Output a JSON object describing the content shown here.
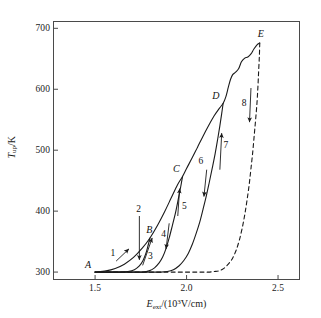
{
  "chart_data": {
    "type": "line",
    "title": "",
    "xlabel": "E_ext/(10^3 V/cm)",
    "ylabel": "T_up/K",
    "xlim": [
      1.27,
      2.62
    ],
    "ylim": [
      287,
      712
    ],
    "xticks": [
      "1.5",
      "2.0",
      "2.5"
    ],
    "xtick_values": [
      1.5,
      2.0,
      2.5
    ],
    "yticks": [
      "300",
      "400",
      "500",
      "600",
      "700"
    ],
    "ytick_values": [
      300,
      400,
      500,
      600,
      700
    ],
    "grid": false,
    "legend": null,
    "axis_title_x_parts": {
      "symbol": "E",
      "subscript": "ext",
      "rest_open": "/(10",
      "exponent": "3",
      "rest_close": "V/cm)"
    },
    "axis_title_y_parts": {
      "symbol": "T",
      "subscript": "up",
      "rest": "/K"
    },
    "annotations": {
      "points": [
        {
          "label": "A",
          "x": 1.5,
          "y": 300,
          "label_dx": -10,
          "label_dy": -12
        },
        {
          "label": "B",
          "x": 1.79,
          "y": 356,
          "label_dx": -2,
          "label_dy": -13
        },
        {
          "label": "C",
          "x": 1.98,
          "y": 457,
          "label_dx": -10,
          "label_dy": -12
        },
        {
          "label": "D",
          "x": 2.2,
          "y": 577,
          "label_dx": -11,
          "label_dy": -12
        },
        {
          "label": "E",
          "x": 2.4,
          "y": 676,
          "label_dx": -2,
          "label_dy": -14
        }
      ],
      "arrows": [
        {
          "label": "1",
          "x1": 1.615,
          "y1": 318,
          "x2": 1.685,
          "y2": 338,
          "lx": 1.6,
          "ly": 332,
          "dir": "up-right"
        },
        {
          "label": "2",
          "x1": 1.742,
          "y1": 392,
          "x2": 1.742,
          "y2": 320,
          "lx": 1.742,
          "ly": 404,
          "dir": "down"
        },
        {
          "label": "3",
          "x1": 1.76,
          "y1": 311,
          "x2": 1.812,
          "y2": 356,
          "lx": 1.805,
          "ly": 327,
          "dir": "up-right"
        },
        {
          "label": "4",
          "x1": 1.905,
          "y1": 380,
          "x2": 1.888,
          "y2": 338,
          "lx": 1.878,
          "ly": 362,
          "dir": "down"
        },
        {
          "label": "5",
          "x1": 1.952,
          "y1": 392,
          "x2": 1.962,
          "y2": 437,
          "lx": 1.992,
          "ly": 408,
          "dir": "up"
        },
        {
          "label": "6",
          "x1": 2.11,
          "y1": 468,
          "x2": 2.095,
          "y2": 424,
          "lx": 2.082,
          "ly": 482,
          "dir": "down"
        },
        {
          "label": "7",
          "x1": 2.182,
          "y1": 468,
          "x2": 2.192,
          "y2": 528,
          "lx": 2.218,
          "ly": 508,
          "dir": "up"
        },
        {
          "label": "8",
          "x1": 2.352,
          "y1": 602,
          "x2": 2.344,
          "y2": 546,
          "lx": 2.318,
          "ly": 578,
          "dir": "down"
        }
      ]
    },
    "series": [
      {
        "name": "loop-1-outer-up (A to B to C to D to E, main envelope)",
        "style": "solid",
        "points": [
          [
            1.5,
            300
          ],
          [
            1.56,
            302
          ],
          [
            1.61,
            306
          ],
          [
            1.66,
            313
          ],
          [
            1.71,
            324
          ],
          [
            1.76,
            340
          ],
          [
            1.8,
            356
          ],
          [
            1.84,
            376
          ],
          [
            1.88,
            399
          ],
          [
            1.915,
            421
          ],
          [
            1.95,
            443
          ],
          [
            1.978,
            457
          ],
          [
            2.0,
            470
          ],
          [
            2.03,
            487
          ],
          [
            2.06,
            505
          ],
          [
            2.09,
            523
          ],
          [
            2.12,
            540
          ],
          [
            2.15,
            556
          ],
          [
            2.18,
            569
          ],
          [
            2.2,
            577
          ],
          [
            2.215,
            588
          ],
          [
            2.228,
            603
          ],
          [
            2.24,
            616
          ],
          [
            2.252,
            624
          ],
          [
            2.268,
            628
          ],
          [
            2.285,
            634
          ],
          [
            2.3,
            645
          ],
          [
            2.318,
            651
          ],
          [
            2.335,
            653
          ],
          [
            2.352,
            658
          ],
          [
            2.368,
            666
          ],
          [
            2.385,
            673
          ],
          [
            2.4,
            676
          ]
        ]
      },
      {
        "name": "branch-B-return (loop 1: down from B back to baseline)",
        "style": "solid",
        "points": [
          [
            1.8,
            356
          ],
          [
            1.79,
            344
          ],
          [
            1.778,
            331
          ],
          [
            1.762,
            319
          ],
          [
            1.742,
            310
          ],
          [
            1.715,
            304
          ],
          [
            1.68,
            301
          ],
          [
            1.64,
            300
          ],
          [
            1.6,
            300
          ],
          [
            1.56,
            300
          ],
          [
            1.52,
            300
          ],
          [
            1.5,
            300
          ]
        ]
      },
      {
        "name": "branch-C-return (loop 2: down from C to baseline)",
        "style": "solid",
        "points": [
          [
            1.978,
            457
          ],
          [
            1.968,
            440
          ],
          [
            1.955,
            420
          ],
          [
            1.94,
            398
          ],
          [
            1.922,
            376
          ],
          [
            1.905,
            356
          ],
          [
            1.888,
            339
          ],
          [
            1.87,
            325
          ],
          [
            1.85,
            315
          ],
          [
            1.825,
            307
          ],
          [
            1.795,
            302
          ],
          [
            1.76,
            300
          ],
          [
            1.72,
            300
          ],
          [
            1.68,
            300
          ],
          [
            1.64,
            300
          ],
          [
            1.6,
            300
          ],
          [
            1.55,
            300
          ],
          [
            1.5,
            300
          ]
        ]
      },
      {
        "name": "branch-D-return (loop 3: down from D to baseline)",
        "style": "solid",
        "points": [
          [
            2.2,
            577
          ],
          [
            2.192,
            560
          ],
          [
            2.182,
            540
          ],
          [
            2.17,
            518
          ],
          [
            2.156,
            494
          ],
          [
            2.14,
            470
          ],
          [
            2.124,
            447
          ],
          [
            2.108,
            425
          ],
          [
            2.09,
            403
          ],
          [
            2.072,
            382
          ],
          [
            2.052,
            363
          ],
          [
            2.032,
            346
          ],
          [
            2.01,
            331
          ],
          [
            1.985,
            319
          ],
          [
            1.958,
            310
          ],
          [
            1.928,
            304
          ],
          [
            1.895,
            301
          ],
          [
            1.86,
            300
          ],
          [
            1.82,
            300
          ],
          [
            1.78,
            300
          ],
          [
            1.73,
            300
          ],
          [
            1.68,
            300
          ],
          [
            1.62,
            300
          ],
          [
            1.56,
            300
          ],
          [
            1.5,
            300
          ]
        ]
      },
      {
        "name": "branch-E-return-dashed (loop 4: down from E to baseline)",
        "style": "dashed",
        "points": [
          [
            2.4,
            676
          ],
          [
            2.398,
            655
          ],
          [
            2.394,
            630
          ],
          [
            2.39,
            604
          ],
          [
            2.385,
            578
          ],
          [
            2.378,
            552
          ],
          [
            2.37,
            525
          ],
          [
            2.362,
            498
          ],
          [
            2.352,
            470
          ],
          [
            2.342,
            443
          ],
          [
            2.33,
            417
          ],
          [
            2.318,
            394
          ],
          [
            2.304,
            372
          ],
          [
            2.288,
            352
          ],
          [
            2.27,
            335
          ],
          [
            2.25,
            322
          ],
          [
            2.228,
            313
          ],
          [
            2.204,
            306
          ],
          [
            2.178,
            302
          ],
          [
            2.15,
            301
          ],
          [
            2.12,
            300
          ],
          [
            2.085,
            300
          ],
          [
            2.045,
            300
          ],
          [
            2.0,
            300
          ],
          [
            1.95,
            300
          ],
          [
            1.9,
            300
          ],
          [
            1.84,
            300
          ],
          [
            1.78,
            300
          ],
          [
            1.72,
            300
          ],
          [
            1.65,
            300
          ],
          [
            1.58,
            300
          ],
          [
            1.5,
            300
          ]
        ]
      }
    ]
  }
}
